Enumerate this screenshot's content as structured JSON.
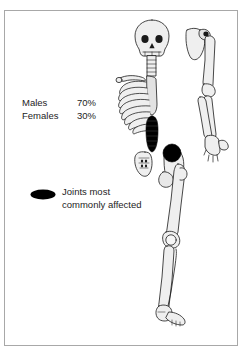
{
  "figure": {
    "type": "anatomical-diagram",
    "background_color": "#ffffff",
    "frame_color": "#a8a8a8",
    "bone_fill": "#efefef",
    "bone_outline": "#1a1a1a",
    "marker_color": "#000000",
    "text_color": "#1d1d1d"
  },
  "stats": {
    "rows": [
      {
        "label": "Males",
        "value": "70%"
      },
      {
        "label": "Females",
        "value": "30%"
      }
    ]
  },
  "legend": {
    "swatch_name": "black-ellipse-marker",
    "line1": "Joints most",
    "line2": "commonly affected"
  },
  "markers": [
    {
      "name": "lumbar-spine-marker",
      "shape": "vertical-oval"
    },
    {
      "name": "hip-joint-marker",
      "shape": "circle"
    }
  ],
  "skeleton_parts": [
    "skull",
    "cervical-spine",
    "clavicle",
    "rib-cage",
    "sternum",
    "thoracic-spine",
    "lumbar-spine",
    "sacrum",
    "pelvis",
    "scapula",
    "humerus",
    "radius",
    "ulna",
    "hand",
    "femur",
    "patella",
    "tibia",
    "fibula",
    "foot"
  ]
}
